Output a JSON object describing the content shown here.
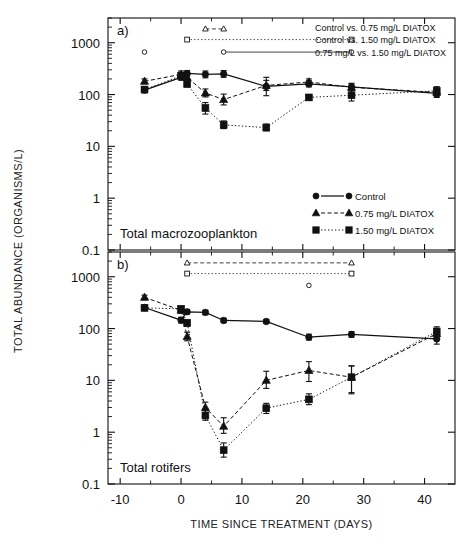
{
  "figure": {
    "xlabel": "TIME SINCE TREATMENT (DAYS)",
    "ylabel": "TOTAL ABUNDANCE (ORGANISMS/L)",
    "panel_a_letter": "a)",
    "panel_b_letter": "b)",
    "panel_a_inner": "Total macrozooplankton",
    "panel_b_inner": "Total rotifers"
  },
  "legend": {
    "items": [
      {
        "label": "Control",
        "marker": "circle",
        "line": "solid"
      },
      {
        "label": "0.75 mg/L DIATOX",
        "marker": "triangle",
        "line": "dashed"
      },
      {
        "label": "1.50 mg/L DIATOX",
        "marker": "square",
        "line": "dotted"
      }
    ]
  },
  "significance_legend": {
    "items": [
      {
        "label": "Control vs. 0.75 mg/L DIATOX",
        "marker": "triangle",
        "line": "dashed"
      },
      {
        "label": "Control vs. 1.50 mg/L DIATOX",
        "marker": "square",
        "line": "dotted"
      },
      {
        "label": "0.75 mg/L vs. 1.50 mg/L DIATOX",
        "marker": "circle",
        "line": "solid"
      }
    ]
  },
  "axis": {
    "x_ticks": [
      -10,
      0,
      10,
      20,
      30,
      40
    ],
    "x_ticklabels": [
      "-10",
      "0",
      "10",
      "20",
      "30",
      "40"
    ],
    "x_minor_ticks": [
      -5,
      5,
      15,
      25,
      35
    ],
    "xlim": [
      -12,
      45
    ],
    "y_ticks": [
      0.1,
      1,
      10,
      100,
      1000
    ],
    "y_ticklabels": [
      "0.1",
      "1",
      "10",
      "100",
      "1000"
    ],
    "ylim": [
      0.1,
      3000
    ],
    "yscale": "log",
    "grid": false
  },
  "chart_data": [
    {
      "type": "line",
      "panel": "a",
      "title": "Total macrozooplankton",
      "xlabel": "TIME SINCE TREATMENT (DAYS)",
      "ylabel": "TOTAL ABUNDANCE (ORGANISMS/L)",
      "yscale": "log",
      "ylim": [
        0.1,
        3000
      ],
      "xlim": [
        -12,
        45
      ],
      "series": [
        {
          "name": "Control",
          "marker": "circle",
          "line": "solid",
          "x": [
            -6,
            0,
            1,
            4,
            7,
            14,
            21,
            28,
            42
          ],
          "y": [
            122,
            215,
            255,
            245,
            250,
            143,
            160,
            140,
            105
          ],
          "yerr_low": [
            108,
            190,
            225,
            210,
            215,
            95,
            140,
            120,
            88
          ],
          "yerr_high": [
            138,
            250,
            290,
            285,
            290,
            215,
            185,
            165,
            125
          ]
        },
        {
          "name": "0.75 mg/L DIATOX",
          "marker": "triangle",
          "line": "dashed",
          "x": [
            -6,
            0,
            1,
            4,
            7,
            14,
            21,
            28,
            42
          ],
          "y": [
            180,
            245,
            215,
            107,
            80,
            150,
            175,
            138,
            110
          ],
          "yerr_low": [
            162,
            215,
            195,
            90,
            63,
            120,
            152,
            118,
            92
          ],
          "yerr_high": [
            200,
            285,
            240,
            128,
            102,
            188,
            200,
            160,
            132
          ]
        },
        {
          "name": "1.50 mg/L DIATOX",
          "marker": "square",
          "line": "dotted",
          "x": [
            -6,
            0,
            1,
            4,
            7,
            14,
            21,
            28,
            42
          ],
          "y": [
            125,
            230,
            160,
            55,
            26,
            23,
            88,
            97,
            118
          ],
          "yerr_low": [
            112,
            200,
            142,
            42,
            22,
            20,
            78,
            75,
            96
          ],
          "yerr_high": [
            140,
            268,
            180,
            70,
            31,
            27,
            99,
            125,
            142
          ]
        }
      ],
      "significance_bars": [
        {
          "comparison": "Control vs. 0.75 mg/L DIATOX",
          "marker": "triangle",
          "line": "dashed",
          "x_start": 4,
          "x_end": 7,
          "level": 1850
        },
        {
          "comparison": "Control vs. 1.50 mg/L DIATOX",
          "marker": "square",
          "line": "dotted",
          "x_start": 1,
          "x_end": 28,
          "level": 1150
        },
        {
          "comparison": "0.75 mg/L vs. 1.50 mg/L DIATOX",
          "marker": "circle",
          "line": "solid",
          "x_start": 7,
          "x_end": 28,
          "level": 660
        }
      ],
      "isolated_marks": [
        {
          "marker": "circle",
          "x": -6,
          "y": 660
        }
      ]
    },
    {
      "type": "line",
      "panel": "b",
      "title": "Total rotifers",
      "xlabel": "TIME SINCE TREATMENT (DAYS)",
      "ylabel": "TOTAL ABUNDANCE (ORGANISMS/L)",
      "yscale": "log",
      "ylim": [
        0.1,
        3000
      ],
      "xlim": [
        -12,
        45
      ],
      "series": [
        {
          "name": "Control",
          "marker": "circle",
          "line": "solid",
          "x": [
            -6,
            0,
            1,
            4,
            7,
            14,
            21,
            28,
            42
          ],
          "y": [
            255,
            145,
            210,
            205,
            143,
            137,
            68,
            77,
            63
          ],
          "yerr_low": [
            230,
            128,
            190,
            185,
            130,
            125,
            60,
            68,
            50
          ],
          "yerr_high": [
            280,
            165,
            232,
            225,
            158,
            150,
            78,
            87,
            78
          ]
        },
        {
          "name": "0.75 mg/L DIATOX",
          "marker": "triangle",
          "line": "dashed",
          "x": [
            -6,
            0,
            1,
            4,
            7,
            14,
            21,
            28,
            42
          ],
          "y": [
            400,
            225,
            70,
            3.0,
            1.3,
            10,
            15.5,
            11.5,
            80
          ],
          "yerr_low": [
            360,
            198,
            58,
            2.4,
            0.95,
            7.0,
            9.5,
            5.5,
            62
          ],
          "yerr_high": [
            440,
            255,
            85,
            3.8,
            1.9,
            15.0,
            23.0,
            19.0,
            100
          ]
        },
        {
          "name": "1.50 mg/L DIATOX",
          "marker": "square",
          "line": "dotted",
          "x": [
            -6,
            0,
            1,
            4,
            7,
            14,
            21,
            28,
            42
          ],
          "y": [
            250,
            240,
            128,
            2.1,
            0.45,
            2.9,
            4.3,
            11.5,
            88
          ],
          "yerr_low": [
            228,
            212,
            112,
            1.7,
            0.33,
            2.3,
            3.4,
            5.8,
            70
          ],
          "yerr_high": [
            272,
            270,
            146,
            2.6,
            0.62,
            3.6,
            5.5,
            19.0,
            108
          ]
        }
      ],
      "significance_bars": [
        {
          "comparison": "Control vs. 0.75 mg/L DIATOX",
          "marker": "triangle",
          "line": "dashed",
          "x_start": 1,
          "x_end": 28,
          "level": 1850
        },
        {
          "comparison": "Control vs. 1.50 mg/L DIATOX",
          "marker": "square",
          "line": "dotted",
          "x_start": 1,
          "x_end": 28,
          "level": 1150
        },
        {
          "comparison": "0.75 mg/L vs. 1.50 mg/L DIATOX",
          "marker": "circle",
          "line": "solid",
          "x_start": 21,
          "x_end": 21,
          "level": 680
        }
      ],
      "isolated_marks": []
    }
  ]
}
